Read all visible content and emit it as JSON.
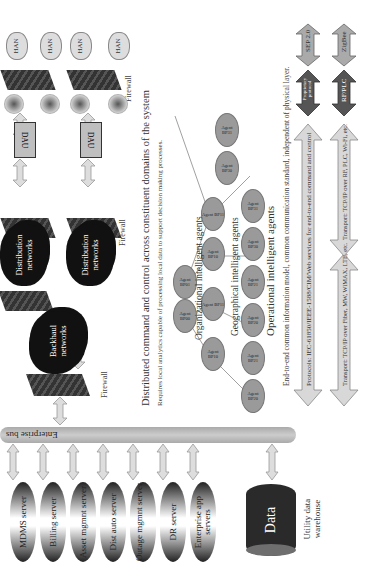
{
  "servers": [
    {
      "label": "MDMS server"
    },
    {
      "label": "Billing server"
    },
    {
      "label": "Asset mgmnt server"
    },
    {
      "label": "Dist auto server"
    },
    {
      "label": "Outage mgmnt server"
    },
    {
      "label": "DR server"
    },
    {
      "label": "Enterprise app servers"
    }
  ],
  "data_store": {
    "label": "Data",
    "caption": "Utility data warehouse"
  },
  "bus": {
    "label": "Enterprise bus"
  },
  "firewall_label": "Firewall",
  "clouds": {
    "backhaul": "Backhaul networks",
    "distribution_1": "Distribution networks",
    "distribution_2": "Distribution networks"
  },
  "dau_label": "DAU",
  "han_label": "HAN",
  "headline": "Distributed command and control across constituent domains of the system",
  "subline": "Requires local analytics capable of processing local data to support decision making processes.",
  "agent_groups": {
    "organizational": "Organizational intelligent agents",
    "geographical": "Geographical intelligent agents",
    "operational": "Operational intelligent agents"
  },
  "agents": {
    "org": [
      "Agent BP00",
      "Agent BP01"
    ],
    "geo": [
      "Agent BP10",
      "Agent BP11",
      "Agent BP10",
      "Agent BP11"
    ],
    "ops": [
      "Agent BP20",
      "Agent BP21",
      "Agent BP20",
      "Agent BP21",
      "Agent BP30",
      "Agent BP31",
      "Agent BP30",
      "Agent BP31"
    ]
  },
  "footer_text": "End-to-end common information model, common communication standard, independent of physical layer.",
  "protocols_arrow": "Protocols: IEC-61850/IEEE-1588/CIM/Web services for end-to-end command and control",
  "transport_left": "Transport: TCP/IP over Fiber, MW, WiMAX, LTE, etc.",
  "transport_right": "Transport: TCP/IP over RF, PLC, Wi-Fi, etc.",
  "small_arrows": {
    "proprietary": "Proprietary protocol",
    "sep": "SEP 2.0",
    "rfplc": "RF/PLC",
    "zigbee": "ZigBee"
  }
}
